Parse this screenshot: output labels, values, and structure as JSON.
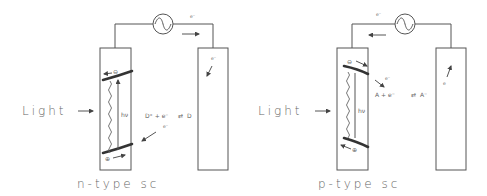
{
  "colors": {
    "line": "#555555",
    "band": "#333333",
    "text": "#666666",
    "background": "#ffffff"
  },
  "panels": [
    {
      "id": "n-type",
      "light_label": "Light",
      "caption": "n-type sc",
      "photon_label": "hν",
      "circuit_electron_label": "e⁻",
      "counter_electrode_electron_label": "e⁻",
      "conduction_band_carrier": "⊖",
      "valence_band_carrier": "⊕",
      "reaction": {
        "left": "D⁺ + e⁻",
        "arrows": "⇄",
        "right": "D"
      },
      "interface_electron_label": "e⁻",
      "icons": [
        "ac-source-icon",
        "arrow-right-icon"
      ]
    },
    {
      "id": "p-type",
      "light_label": "Light",
      "caption": "p-type sc",
      "photon_label": "hν",
      "circuit_electron_label": "e⁻",
      "counter_electrode_electron_label": "e",
      "conduction_band_carrier": "⊖",
      "valence_band_carrier": "⊕",
      "reaction": {
        "left": "A + e⁻",
        "arrows": "⇄",
        "right": "A⁻"
      },
      "interface_electron_label": "e⁻",
      "icons": [
        "ac-source-icon",
        "arrow-left-icon"
      ]
    }
  ]
}
